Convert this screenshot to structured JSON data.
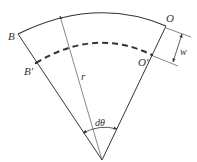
{
  "diagram": {
    "type": "sector-geometry",
    "labels": {
      "B": "B",
      "B_prime": "B′",
      "O": "O",
      "O_prime": "O′",
      "r": "r",
      "dtheta": "dθ",
      "w": "w"
    },
    "colors": {
      "stroke": "#333333",
      "background": "#ffffff"
    }
  }
}
